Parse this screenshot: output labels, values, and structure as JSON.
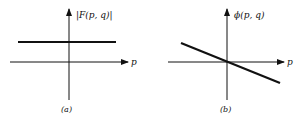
{
  "panels": [
    {
      "caption": "(a)",
      "y_label": "|F(p, q)|",
      "x_label": "p",
      "curve": "constant horizontal line"
    },
    {
      "caption": "(b)",
      "y_label": "ϕ(p, q)",
      "x_label": "p",
      "curve": "straight line with negative slope through origin"
    }
  ],
  "colors": {
    "ink": "#111111",
    "background": "#ffffff"
  }
}
